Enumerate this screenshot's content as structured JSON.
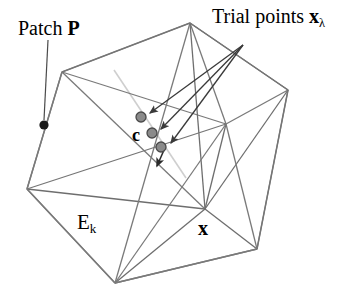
{
  "figure": {
    "labels": {
      "patch_text": "Patch ",
      "patch_symbol": "P",
      "trial_text": "Trial points ",
      "trial_symbol": "x",
      "trial_subscript": "λ",
      "element_symbol": "E",
      "element_subscript": "k",
      "centroid_symbol": "c",
      "vertex_symbol": "x"
    },
    "colors": {
      "background": "#ffffff",
      "mesh_line": "#7a7a7a",
      "dark_line": "#4a4a4a",
      "faint_line": "#c9c9c9",
      "trial_point_fill": "#8a8a8a",
      "trial_point_stroke": "#4a4a4a",
      "patch_point_fill": "#1a1a1a",
      "arrow": "#3a3a3a",
      "text": "#000000"
    },
    "geometry": {
      "outer_vertices": [
        {
          "name": "top",
          "x": 190,
          "y": 23
        },
        {
          "name": "right",
          "x": 288,
          "y": 90
        },
        {
          "name": "bottom-right",
          "x": 257,
          "y": 249
        },
        {
          "name": "bottom",
          "x": 115,
          "y": 283
        },
        {
          "name": "left",
          "x": 27,
          "y": 189
        },
        {
          "name": "upper-left",
          "x": 62,
          "y": 72
        }
      ],
      "hub_vertex": {
        "name": "x",
        "x": 205,
        "y": 209
      },
      "interior_vertex": {
        "name": "interior-junction",
        "x": 226,
        "y": 124
      },
      "patch_point": {
        "x": 44,
        "y": 125
      },
      "trial_points": [
        {
          "index": 1,
          "x": 141,
          "y": 117
        },
        {
          "index": 2,
          "x": 152,
          "y": 133
        },
        {
          "index": 3,
          "x": 161,
          "y": 147
        }
      ],
      "arrow_origin": {
        "x": 243,
        "y": 45
      },
      "patch_leader": {
        "x1": 47,
        "y1": 41,
        "x2": 44,
        "y2": 120
      }
    }
  }
}
